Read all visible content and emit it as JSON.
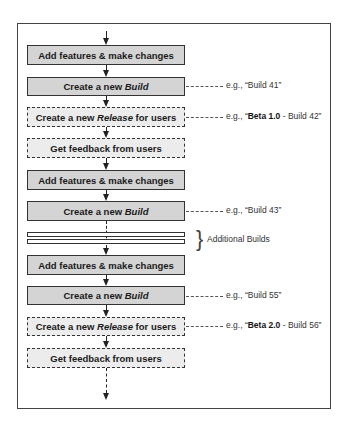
{
  "diagram": {
    "type": "flowchart",
    "steps": [
      {
        "id": 1,
        "style": "solid",
        "label_parts": [
          "Add features & make changes"
        ]
      },
      {
        "id": 2,
        "style": "solid",
        "label_prefix": "Create a new ",
        "label_em": "Build",
        "label_suffix": ""
      },
      {
        "id": 3,
        "style": "dashed",
        "label_prefix": "Create a new ",
        "label_em": "Release",
        "label_suffix": " for users"
      },
      {
        "id": 4,
        "style": "dashed",
        "label_parts": [
          "Get feedback from users"
        ]
      },
      {
        "id": 5,
        "style": "solid",
        "label_parts": [
          "Add features & make changes"
        ]
      },
      {
        "id": 6,
        "style": "solid",
        "label_prefix": "Create a new ",
        "label_em": "Build",
        "label_suffix": ""
      },
      {
        "id": 7,
        "style": "solid",
        "label_parts": [
          "Add features & make changes"
        ]
      },
      {
        "id": 8,
        "style": "solid",
        "label_prefix": "Create a new ",
        "label_em": "Build",
        "label_suffix": ""
      },
      {
        "id": 9,
        "style": "dashed",
        "label_prefix": "Create a new ",
        "label_em": "Release",
        "label_suffix": " for users"
      },
      {
        "id": 10,
        "style": "dashed",
        "label_parts": [
          "Get feedback from users"
        ]
      }
    ],
    "step1": "Add features & make changes",
    "create_prefix": "Create a new ",
    "build_em": "Build",
    "release_em": "Release",
    "release_suffix": " for users",
    "feedback": "Get feedback from users",
    "annotations": {
      "a1": {
        "prefix": "e.g., “",
        "bold": "",
        "text": "Build 41”"
      },
      "a2": {
        "prefix": "e.g., “",
        "bold": "Beta 1.0",
        "text": " - Build 42”"
      },
      "a3": {
        "prefix": "e.g., “",
        "bold": "",
        "text": "Build 43”"
      },
      "a4": {
        "prefix": "e.g., “",
        "bold": "",
        "text": "Build 55”"
      },
      "a5": {
        "prefix": "e.g., “",
        "bold": "Beta 2.0",
        "text": " - Build 56”"
      }
    },
    "brace": {
      "glyph": "}",
      "label": "Additional Builds"
    },
    "colors": {
      "solid_fill": "#d4d4d4",
      "dashed_fill": "#ececec",
      "stroke": "#333333"
    }
  }
}
